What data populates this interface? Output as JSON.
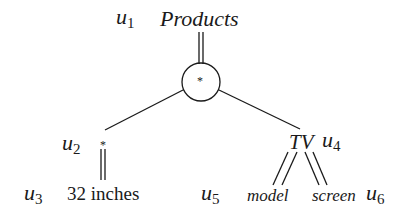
{
  "diagram": {
    "type": "tree-pattern",
    "nodes": [
      {
        "id": "u1",
        "var": "u",
        "sub": "1",
        "label": "Products",
        "style": "italic"
      },
      {
        "id": "center",
        "label": "*",
        "shape": "circle"
      },
      {
        "id": "u2",
        "var": "u",
        "sub": "2",
        "label": "*",
        "style": "normal"
      },
      {
        "id": "u3",
        "var": "u",
        "sub": "3",
        "label": "32 inches",
        "style": "normal"
      },
      {
        "id": "u4",
        "var": "u",
        "sub": "4",
        "label": "TV",
        "style": "italic"
      },
      {
        "id": "u5",
        "var": "u",
        "sub": "5",
        "label": "model",
        "style": "italic"
      },
      {
        "id": "u6",
        "var": "u",
        "sub": "6",
        "label": "screen",
        "style": "italic"
      }
    ],
    "edges": [
      {
        "from": "u1",
        "to": "center",
        "kind": "double"
      },
      {
        "from": "center",
        "to": "u2",
        "kind": "single"
      },
      {
        "from": "center",
        "to": "u4",
        "kind": "single"
      },
      {
        "from": "u2",
        "to": "u3",
        "kind": "double"
      },
      {
        "from": "u4",
        "to": "u5",
        "kind": "double"
      },
      {
        "from": "u4",
        "to": "u6",
        "kind": "double"
      }
    ]
  }
}
